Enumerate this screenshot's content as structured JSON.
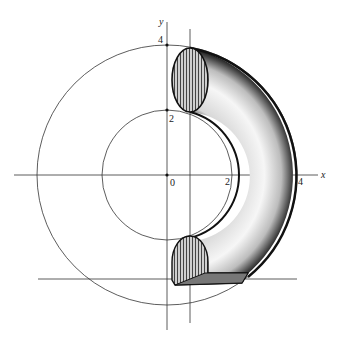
{
  "diagram": {
    "type": "torus-section",
    "axes": {
      "x_label": "x",
      "y_label": "y",
      "origin_label": "0",
      "x_ticks": [
        "2",
        "4"
      ],
      "y_ticks": [
        "2",
        "4"
      ]
    },
    "circles": [
      {
        "name": "outer-circle",
        "radius": 4
      },
      {
        "name": "inner-circle",
        "radius": 2
      }
    ],
    "colors": {
      "line": "#222222",
      "shade_dark": "#333333",
      "shade_light": "#bbbbbb",
      "background": "#ffffff"
    }
  }
}
